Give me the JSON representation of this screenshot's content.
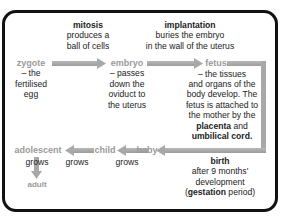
{
  "diagram": {
    "colors": {
      "frame": "#111111",
      "arrow": "#a8a8a8",
      "stage_label": "#9a9a9a",
      "text": "#222222"
    },
    "stages": {
      "zygote": {
        "label": "zygote",
        "desc_lines": [
          "– the",
          "fertilised",
          "egg"
        ]
      },
      "embryo": {
        "label": "embryo",
        "desc_lines": [
          "– passes",
          "down the",
          "oviduct to",
          "the uterus"
        ]
      },
      "fetus": {
        "label": "fetus",
        "desc_lines": [
          "– the tissues",
          "and organs of the",
          "body develop. The",
          "fetus is attached to",
          "the mother by the"
        ],
        "placenta": "placenta",
        "and": "and",
        "umbilical": "umbilical cord."
      },
      "baby": {
        "label": "baby",
        "desc": "grows"
      },
      "child": {
        "label": "child",
        "desc": "grows"
      },
      "adolescent": {
        "label": "adolescent",
        "desc": "grows"
      },
      "adult": {
        "label": "adult"
      }
    },
    "processes": {
      "mitosis": {
        "title": "mitosis",
        "lines": [
          "produces a",
          "ball of cells"
        ]
      },
      "implantation": {
        "title": "implantation",
        "lines": [
          "buries the embryo",
          "in the wall of the uterus"
        ]
      },
      "birth": {
        "title": "birth",
        "lines": [
          "after 9 months'",
          "development"
        ],
        "open": "(",
        "gestation": "gestation",
        "close": " period)"
      }
    }
  }
}
